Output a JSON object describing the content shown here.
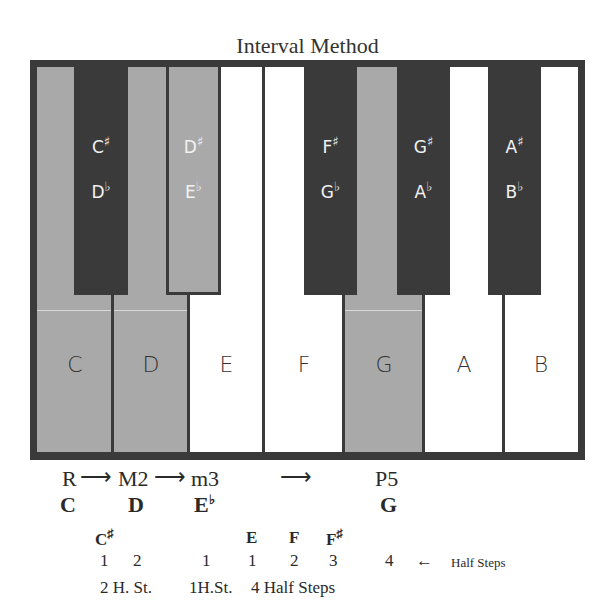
{
  "title": "Interval Method",
  "white_keys": [
    {
      "note": "C",
      "highlighted": true
    },
    {
      "note": "D",
      "highlighted": true
    },
    {
      "note": "E",
      "highlighted": false
    },
    {
      "note": "F",
      "highlighted": false
    },
    {
      "note": "G",
      "highlighted": true
    },
    {
      "note": "A",
      "highlighted": false
    },
    {
      "note": "B",
      "highlighted": false
    }
  ],
  "black_keys": [
    {
      "sharp": "C",
      "flat": "D",
      "highlighted": false
    },
    {
      "sharp": "D",
      "flat": "E",
      "highlighted": true
    },
    {
      "sharp": "F",
      "flat": "G",
      "highlighted": false
    },
    {
      "sharp": "G",
      "flat": "A",
      "highlighted": false
    },
    {
      "sharp": "A",
      "flat": "B",
      "highlighted": false
    }
  ],
  "symbols": {
    "sharp": "♯",
    "flat": "♭",
    "arrow_right": "⟶",
    "arrow_left": "←"
  },
  "intervals": {
    "root": "R",
    "major_second": "M2",
    "minor_third": "m3",
    "perfect_fifth": "P5"
  },
  "chord_notes": {
    "root": "C",
    "second": "D",
    "third": "E",
    "fifth": "G"
  },
  "passing_notes": {
    "c_sharp": "C",
    "e": "E",
    "f": "F",
    "f_sharp": "F"
  },
  "counts": [
    "1",
    "2",
    "1",
    "1",
    "2",
    "3",
    "4"
  ],
  "half_steps_label": "Half Steps",
  "summaries": {
    "two": "2 H. St.",
    "one": "1H.St.",
    "four": "4 Half Steps"
  },
  "colors": {
    "frame": "#3a3a3a",
    "highlight": "#a9a9a9",
    "white": "#ffffff"
  }
}
